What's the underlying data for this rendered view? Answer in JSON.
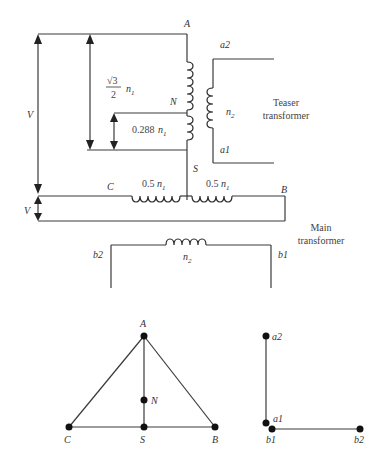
{
  "diagram": {
    "teaser": {
      "label_line1": "Teaser",
      "label_line2": "transformer",
      "terminal_top": "A",
      "tap": "N",
      "terminal_bottom": "S",
      "primary_full_ratio_num": "√3",
      "primary_full_ratio_den": "2",
      "primary_full_symbol": "n",
      "primary_full_sub": "1",
      "primary_tap_label": "0.288",
      "primary_tap_symbol": "n",
      "primary_tap_sub": "1",
      "secondary_symbol": "n",
      "secondary_sub": "2",
      "sec_top": "a2",
      "sec_bottom": "a1"
    },
    "main": {
      "label_line1": "Main",
      "label_line2": "transformer",
      "left_terminal": "C",
      "right_terminal": "B",
      "left_coil_label": "0.5",
      "right_coil_label": "0.5",
      "coil_symbol": "n",
      "coil_sub": "1",
      "secondary_symbol": "n",
      "secondary_sub": "2",
      "sec_left": "b2",
      "sec_right": "b1"
    },
    "voltage_labels": {
      "teaser_v": "V",
      "main_v": "V"
    },
    "phasor_primary": {
      "nodes": [
        "A",
        "N",
        "C",
        "S",
        "B"
      ]
    },
    "phasor_secondary": {
      "nodes": [
        "a2",
        "a1",
        "b1",
        "b2"
      ]
    }
  }
}
